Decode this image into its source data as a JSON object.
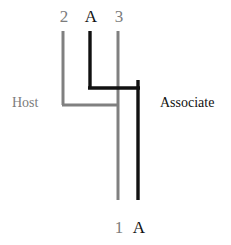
{
  "figure": {
    "type": "tanglegram",
    "width": 231,
    "height": 245,
    "background": "#ffffff"
  },
  "colors": {
    "host": "#808080",
    "associate": "#111111",
    "host_text": "#7c7c7c",
    "associate_text": "#111111"
  },
  "side_labels": {
    "host": "Host",
    "associate": "Associate"
  },
  "host_tree": {
    "name": "host",
    "color": "#808080",
    "tips": [
      {
        "id": "host-tip-2",
        "label": "2",
        "position": "top",
        "x": 63
      },
      {
        "id": "host-tip-3",
        "label": "3",
        "position": "top",
        "x": 118
      },
      {
        "id": "host-tip-1",
        "label": "1",
        "position": "bottom",
        "x": 118
      }
    ],
    "nodes": [
      {
        "id": "host-node-23",
        "y": 105,
        "x_from": 63,
        "x_to": 118
      }
    ]
  },
  "associate_tree": {
    "name": "associate",
    "color": "#111111",
    "tips": [
      {
        "id": "assoc-tip-A-top",
        "label": "A",
        "position": "top",
        "x": 90
      },
      {
        "id": "assoc-tip-A-bottom",
        "label": "A",
        "position": "bottom",
        "x": 138
      }
    ],
    "nodes": [
      {
        "id": "assoc-node-A",
        "y": 88,
        "x_from": 90,
        "x_to": 138
      }
    ]
  },
  "geometry": {
    "top_tip_y": 31,
    "bottom_tip_y": 200,
    "host_branch_y": 105,
    "assoc_branch_y": 88,
    "stroke_width_host": 3,
    "stroke_width_associate": 3.4
  }
}
